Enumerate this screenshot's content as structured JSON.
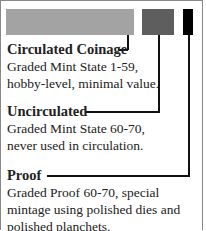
{
  "colors": {
    "circulated": "#a3a3a3",
    "uncirculated": "#5e5e5e",
    "proof": "#000000"
  },
  "categories": [
    {
      "title": "Circulated Coinage",
      "lines": [
        "Graded Mint State 1-59,",
        "hobby-level, minimal value."
      ]
    },
    {
      "title": "Uncirculated",
      "lines": [
        "Graded Mint State 60-70,",
        "never used in circulation."
      ]
    },
    {
      "title": "Proof",
      "lines": [
        "Graded Proof 60-70, special",
        "mintage using polished dies and",
        "polished planchets."
      ]
    }
  ]
}
